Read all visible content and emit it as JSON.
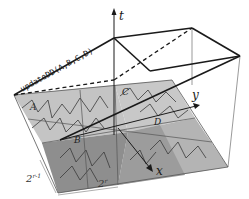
{
  "diagram": {
    "function_label": "updateDD(A,B,C,D)",
    "axes": {
      "t": "t",
      "x": "x",
      "y": "y"
    },
    "regions": [
      "A",
      "B",
      "C",
      "D"
    ],
    "dimensions": {
      "depth": "2",
      "depth_exp": "r-1",
      "width": "2",
      "width_exp": "r"
    },
    "colors": {
      "plane_light": "#c8c8c8",
      "plane_mid": "#a8a8a8",
      "plane_dark": "#8c8c8c",
      "edge": "#1a1a1a",
      "thin_edge": "#555555",
      "curve": "#3a3a3a"
    }
  }
}
